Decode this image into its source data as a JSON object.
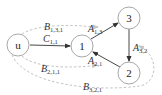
{
  "diagram": {
    "nodes": [
      {
        "id": "u",
        "label": "u",
        "cx": 18,
        "cy": 45
      },
      {
        "id": "1",
        "label": "1",
        "cx": 82,
        "cy": 46
      },
      {
        "id": "3",
        "label": "3",
        "cx": 129,
        "cy": 18
      },
      {
        "id": "2",
        "label": "2",
        "cx": 129,
        "cy": 73
      }
    ],
    "edges": [
      {
        "id": "C11",
        "from": "u",
        "to": "1",
        "style": "solid",
        "label_main": "C",
        "label_sub": "1,1"
      },
      {
        "id": "A13",
        "from": "1",
        "to": "3",
        "style": "solid",
        "label_main": "A",
        "label_sub": "1,3"
      },
      {
        "id": "A32",
        "from": "3",
        "to": "2",
        "style": "solid",
        "label_main": "A",
        "label_sub": "3,2"
      },
      {
        "id": "A21",
        "from": "2",
        "to": "1",
        "style": "solid",
        "label_main": "A",
        "label_sub": "2,1"
      },
      {
        "id": "B131",
        "from": "u",
        "to": "3",
        "style": "dashed",
        "label_main": "B",
        "label_sub": "1,3,1"
      },
      {
        "id": "B211",
        "from": "u",
        "to": "1",
        "style": "dashed",
        "label_main": "B",
        "label_sub": "2,1,1"
      },
      {
        "id": "B321",
        "from": "u",
        "to": "2",
        "style": "dashed",
        "label_main": "B",
        "label_sub": "3,2,1"
      }
    ]
  }
}
